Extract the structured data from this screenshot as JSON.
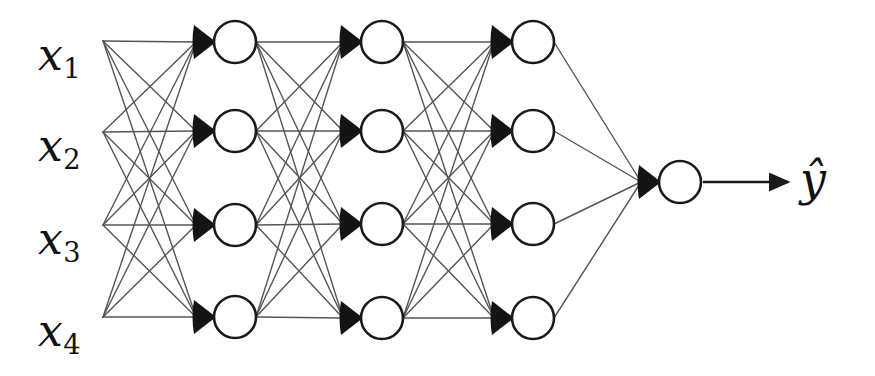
{
  "figure": {
    "type": "neural-network-diagram",
    "background_color": "#ffffff",
    "ink_color": "#1a1a1a",
    "edge_color": "#555555",
    "node_fill": "#ffffff",
    "node_stroke": "#1a1a1a",
    "wedge_color": "#141414"
  },
  "inputs": {
    "count": 4,
    "labels": [
      {
        "base": "x",
        "sub": "1"
      },
      {
        "base": "x",
        "sub": "2"
      },
      {
        "base": "x",
        "sub": "3"
      },
      {
        "base": "x",
        "sub": "4"
      }
    ],
    "fan_out_x": 103,
    "y_positions": [
      41,
      132,
      225,
      317
    ]
  },
  "output": {
    "label": {
      "base": "ŷ",
      "sub": ""
    },
    "label_text": "ŷ",
    "arrow": {
      "from_x": 703,
      "to_x": 788,
      "y": 182
    }
  },
  "layers": [
    {
      "name": "hidden-layer-1",
      "index": 1,
      "node_count": 4,
      "center_x": 235,
      "node_y": [
        42,
        131,
        225,
        317
      ]
    },
    {
      "name": "hidden-layer-2",
      "index": 2,
      "node_count": 4,
      "center_x": 382,
      "node_y": [
        42,
        131,
        224,
        318
      ]
    },
    {
      "name": "hidden-layer-3",
      "index": 3,
      "node_count": 4,
      "center_x": 533,
      "node_y": [
        42,
        131,
        224,
        318
      ]
    },
    {
      "name": "output-layer",
      "index": 4,
      "node_count": 1,
      "center_x": 680,
      "node_y": [
        182
      ]
    }
  ],
  "geometry": {
    "node_radius": 21,
    "wedge_width": 22,
    "wedge_height": 34,
    "edge_width": 1.4,
    "node_stroke_width": 2.6
  }
}
